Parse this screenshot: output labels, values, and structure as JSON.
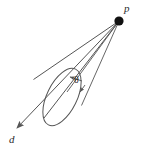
{
  "figure": {
    "background_color": "#ffffff",
    "stroke_color": "#555555",
    "label_color": "#2b2b2b",
    "apex_dot_color": "#111111",
    "labels": {
      "apex_point": "p",
      "direction_vector": "d",
      "half_angle": "θ"
    },
    "geometry": {
      "apex": {
        "x": 119,
        "y": 21,
        "radius": 4.6
      },
      "axis_line": {
        "x1": 119,
        "y1": 21,
        "x2": 14,
        "y2": 131
      },
      "base_ellipse": {
        "cx": 62,
        "cy": 97,
        "rx": 31,
        "ry": 15,
        "rotation_deg": -64
      },
      "edge_lines": [
        {
          "x1": 119,
          "y1": 21,
          "x2": 33,
          "y2": 79
        },
        {
          "x1": 119,
          "y1": 21,
          "x2": 43,
          "y2": 119
        },
        {
          "x1": 119,
          "y1": 21,
          "x2": 67,
          "y2": 92
        },
        {
          "x1": 119,
          "y1": 21,
          "x2": 81,
          "y2": 105
        }
      ],
      "angle_arrows": [
        {
          "x1": 82,
          "y1": 82,
          "x2": 69,
          "y2": 77
        },
        {
          "x1": 86,
          "y1": 86,
          "x2": 80,
          "y2": 93
        }
      ]
    }
  }
}
